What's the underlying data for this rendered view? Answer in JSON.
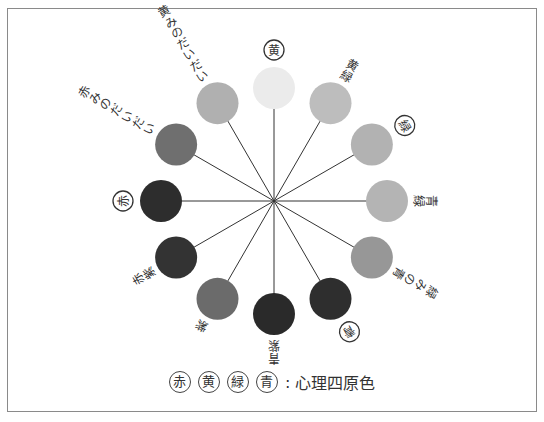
{
  "diagram": {
    "center": [
      274,
      201
    ],
    "ring_radius": 113,
    "circle_radius": 21,
    "colors": [
      {
        "name": "黄",
        "angle": 0,
        "fill": "#ebebeb",
        "primary": true
      },
      {
        "name": "黄緑",
        "angle": 30,
        "fill": "#bdbdbd",
        "primary": false
      },
      {
        "name": "緑",
        "angle": 60,
        "fill": "#b2b2b2",
        "primary": true
      },
      {
        "name": "青緑",
        "angle": 90,
        "fill": "#b4b4b4",
        "primary": false
      },
      {
        "name": "緑みの青",
        "angle": 120,
        "fill": "#979797",
        "primary": false
      },
      {
        "name": "青",
        "angle": 150,
        "fill": "#2e2e2e",
        "primary": true
      },
      {
        "name": "青紫",
        "angle": 180,
        "fill": "#2a2a2a",
        "primary": false
      },
      {
        "name": "紫",
        "angle": 210,
        "fill": "#6b6b6b",
        "primary": false
      },
      {
        "name": "赤紫",
        "angle": 240,
        "fill": "#333333",
        "primary": false
      },
      {
        "name": "赤",
        "angle": 270,
        "fill": "#2d2d2d",
        "primary": true
      },
      {
        "name": "赤みのだいだい",
        "angle": 300,
        "fill": "#6f6f6f",
        "primary": false
      },
      {
        "name": "黄みのだいだい",
        "angle": 330,
        "fill": "#b0b0b0",
        "primary": false
      }
    ]
  },
  "legend": {
    "badges": [
      "赤",
      "黄",
      "緑",
      "青"
    ],
    "separator": ":",
    "text": "心理四原色"
  }
}
